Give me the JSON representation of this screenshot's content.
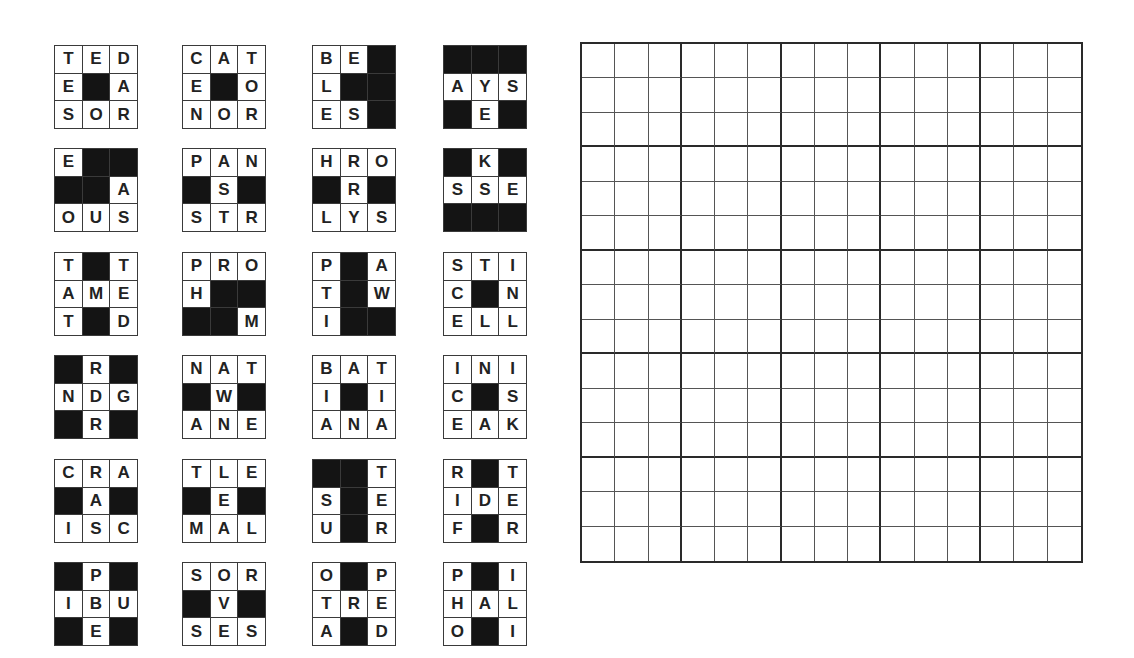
{
  "puzzle": {
    "black_marker": "#",
    "tiles": [
      {
        "rows": [
          "TED",
          "E#A",
          "SOR"
        ]
      },
      {
        "rows": [
          "CAT",
          "E#O",
          "NOR"
        ]
      },
      {
        "rows": [
          "BE#",
          "L##",
          "ES#"
        ]
      },
      {
        "rows": [
          "###",
          "AYS",
          "#E#"
        ]
      },
      {
        "rows": [
          "E##",
          "##A",
          "OUS"
        ]
      },
      {
        "rows": [
          "PAN",
          "#S#",
          "STR"
        ]
      },
      {
        "rows": [
          "HRO",
          "#R#",
          "LYS"
        ]
      },
      {
        "rows": [
          "#K#",
          "SSE",
          "###"
        ]
      },
      {
        "rows": [
          "T#T",
          "AME",
          "T#D"
        ]
      },
      {
        "rows": [
          "PRO",
          "H##",
          "##M"
        ]
      },
      {
        "rows": [
          "P#A",
          "T#W",
          "I##"
        ]
      },
      {
        "rows": [
          "STI",
          "C#N",
          "ELL"
        ]
      },
      {
        "rows": [
          "#R#",
          "NDG",
          "#R#"
        ]
      },
      {
        "rows": [
          "NAT",
          "#W#",
          "ANE"
        ]
      },
      {
        "rows": [
          "BAT",
          "I#I",
          "ANA"
        ]
      },
      {
        "rows": [
          "INI",
          "C#S",
          "EAK"
        ]
      },
      {
        "rows": [
          "CRA",
          "#A#",
          "ISC"
        ]
      },
      {
        "rows": [
          "TLE",
          "#E#",
          "MAL"
        ]
      },
      {
        "rows": [
          "##T",
          "S#E",
          "U#R"
        ]
      },
      {
        "rows": [
          "R#T",
          "IDE",
          "F#R"
        ]
      },
      {
        "rows": [
          "#P#",
          "IBU",
          "#E#"
        ]
      },
      {
        "rows": [
          "SOR",
          "#V#",
          "SES"
        ]
      },
      {
        "rows": [
          "O#P",
          "TRE",
          "A#D"
        ]
      },
      {
        "rows": [
          "P#I",
          "HAL",
          "O#I"
        ]
      }
    ],
    "board": {
      "size": 15,
      "block": 3,
      "filled": []
    }
  }
}
